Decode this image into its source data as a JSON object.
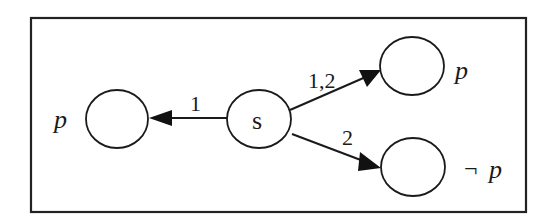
{
  "diagram": {
    "type": "state transition graph (Kripke-style)",
    "frame": {
      "x": 31,
      "y": 18,
      "width": 495,
      "height": 194
    },
    "nodes": [
      {
        "id": "s",
        "label": "s",
        "external_label": "",
        "cx": 259,
        "cy": 119,
        "rx": 32,
        "ry": 29
      },
      {
        "id": "left",
        "label": "",
        "external_label": "p",
        "cx": 117,
        "cy": 119,
        "rx": 31,
        "ry": 29
      },
      {
        "id": "top_right",
        "label": "",
        "external_label": "p",
        "cx": 412,
        "cy": 66,
        "rx": 32,
        "ry": 29
      },
      {
        "id": "bottom_right",
        "label": "",
        "external_label": "¬ p",
        "cx": 413,
        "cy": 167,
        "rx": 32,
        "ry": 29
      }
    ],
    "edges": [
      {
        "from": "s",
        "to": "left",
        "label": "1"
      },
      {
        "from": "s",
        "to": "top_right",
        "label": "1,2"
      },
      {
        "from": "s",
        "to": "bottom_right",
        "label": "2"
      }
    ]
  },
  "labels": {
    "node_s": "s",
    "left_prop": "p",
    "top_right_prop": "p",
    "bottom_right_neg": "¬",
    "bottom_right_prop": "p",
    "edge_left": "1",
    "edge_top": "1,2",
    "edge_bottom": "2"
  },
  "colors": {
    "stroke": "#1a1a1a",
    "background": "#ffffff"
  }
}
